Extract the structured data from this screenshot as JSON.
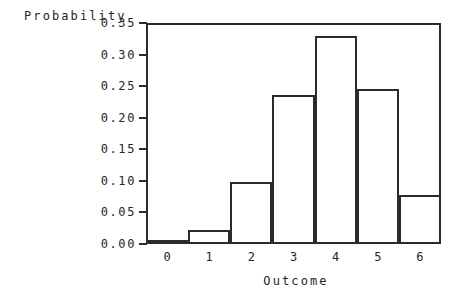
{
  "chart_data": {
    "type": "bar",
    "title": "",
    "xlabel": "Outcome",
    "ylabel": "Probability",
    "categories": [
      "0",
      "1",
      "2",
      "3",
      "4",
      "5",
      "6"
    ],
    "values": [
      0.002,
      0.022,
      0.098,
      0.236,
      0.33,
      0.245,
      0.078
    ],
    "ylim": [
      0.0,
      0.35
    ],
    "xlim": [
      -0.5,
      6.5
    ],
    "yticks": [
      "0.00",
      "0.05",
      "0.10",
      "0.15",
      "0.20",
      "0.25",
      "0.30",
      "0.35"
    ],
    "ytick_values": [
      0.0,
      0.05,
      0.1,
      0.15,
      0.2,
      0.25,
      0.3,
      0.35
    ],
    "xticks": [
      "0",
      "1",
      "2",
      "3",
      "4",
      "5",
      "6"
    ],
    "grid": false,
    "legend": null,
    "bar_style": "outline",
    "bar_fill": "#ffffff",
    "bar_edge": "#2b2b2b",
    "axis_color": "#2b2b2b",
    "background": "#ffffff",
    "text_color": "#262626"
  },
  "axis": {
    "y_title": "Probability",
    "x_title": "Outcome"
  }
}
